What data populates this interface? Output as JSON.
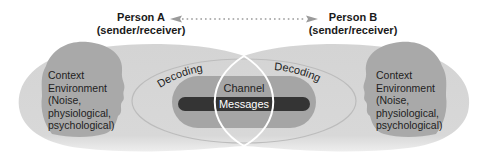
{
  "diagram": {
    "person_a": {
      "name": "Person A",
      "role": "(sender/receiver)"
    },
    "person_b": {
      "name": "Person B",
      "role": "(sender/receiver)"
    },
    "arrow": {
      "style": "dotted",
      "direction": "bidirectional"
    },
    "left_context": [
      "Context",
      "Environment",
      "(Noise,",
      "physiological,",
      "psychological)"
    ],
    "right_context": [
      "Context",
      "Environment",
      "(Noise,",
      "physiological,",
      "psychological)"
    ],
    "decoding_left": "Decoding",
    "decoding_right": "Decoding",
    "channel": "Channel",
    "messages": "Messages"
  },
  "colors": {
    "lobe": "#d6d6d6",
    "head": "#a8a8a8",
    "oval_outline": "#bdbdbd",
    "channel": "#a3a3a3",
    "messages": "#333333",
    "lens": "#ffffff",
    "arrow": "#9a9a9a",
    "text": "#1a1a1a"
  }
}
